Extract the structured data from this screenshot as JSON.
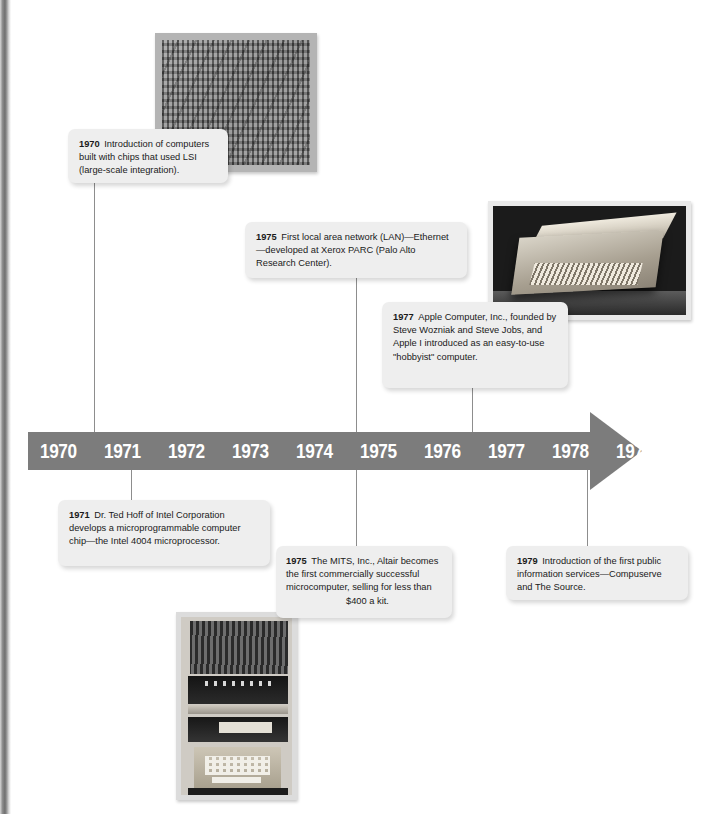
{
  "timeline": {
    "years": [
      "1970",
      "1971",
      "1972",
      "1973",
      "1974",
      "1975",
      "1976",
      "1977",
      "1978",
      "1979"
    ],
    "bar_color": "#7c7c7c",
    "label_color": "#ffffff",
    "direction": "right-arrow"
  },
  "callouts": [
    {
      "id": "callout-1970",
      "year": "1970",
      "text": "Introduction of computers built with chips that used LSI (large-scale integration).",
      "anchor_year": "1970",
      "position": "above"
    },
    {
      "id": "callout-1975-lan",
      "year": "1975",
      "text": "First local area network (LAN)—Ethernet—developed at Xerox PARC (Palo Alto Research Center).",
      "anchor_year": "1975",
      "position": "above"
    },
    {
      "id": "callout-1977",
      "year": "1977",
      "text": "Apple Computer, Inc., founded by Steve Wozniak and Steve Jobs, and Apple I introduced as an easy-to-use \"hobbyist\" computer.",
      "anchor_year": "1977",
      "position": "above"
    },
    {
      "id": "callout-1971",
      "year": "1971",
      "text": "Dr. Ted Hoff of Intel Corporation develops a microprogrammable computer chip—the Intel 4004 microprocessor.",
      "anchor_year": "1971",
      "position": "below"
    },
    {
      "id": "callout-1975-mits",
      "year": "1975",
      "text": "The MITS, Inc., Altair becomes the first commercially successful microcomputer, selling for less than $400 a kit.",
      "anchor_year": "1975",
      "position": "below"
    },
    {
      "id": "callout-1979",
      "year": "1979",
      "text": "Introduction of the first public information services—Compuserve and The Source.",
      "anchor_year": "1979",
      "position": "below"
    }
  ],
  "photos": [
    {
      "id": "photo-lsi-chip",
      "caption": "",
      "depicts": "large-scale-integration chip die, magnified"
    },
    {
      "id": "photo-apple-i",
      "caption": "",
      "depicts": "Apple I computer in wooden case with open lid"
    },
    {
      "id": "photo-altair",
      "caption": "",
      "depicts": "MITS Altair microcomputer system stack with keyboard"
    }
  ]
}
